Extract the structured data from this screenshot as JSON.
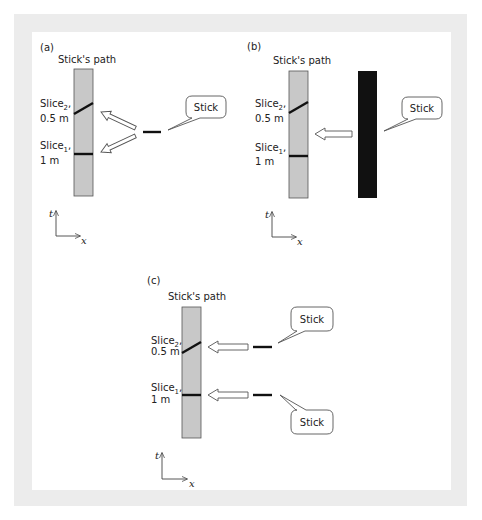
{
  "colors": {
    "frame": "#ececec",
    "background": "#ffffff",
    "path_fill": "#c8c8c8",
    "path_stroke": "#555555",
    "slice": "#111111",
    "stick": "#111111",
    "arrow_stroke": "#555555"
  },
  "panels": [
    {
      "id": "a",
      "label": "(a)",
      "path_title": "Stick's path",
      "slice2": {
        "name": "Slice",
        "sub": "2",
        "suffix": ",",
        "length": "0.5 m"
      },
      "slice1": {
        "name": "Slice",
        "sub": "1",
        "suffix": ",",
        "length": "1 m"
      },
      "stick_callouts": [
        "Stick"
      ],
      "axes": {
        "vertical": "t",
        "horizontal": "x"
      }
    },
    {
      "id": "b",
      "label": "(b)",
      "path_title": "Stick's path",
      "slice2": {
        "name": "Slice",
        "sub": "2",
        "suffix": ",",
        "length": "0.5 m"
      },
      "slice1": {
        "name": "Slice",
        "sub": "1",
        "suffix": ",",
        "length": "1 m"
      },
      "stick_callouts": [
        "Stick"
      ],
      "axes": {
        "vertical": "t",
        "horizontal": "x"
      }
    },
    {
      "id": "c",
      "label": "(c)",
      "path_title": "Stick's path",
      "slice2": {
        "name": "Slice",
        "sub": "2",
        "suffix": ",",
        "length": "0.5 m"
      },
      "slice1": {
        "name": "Slice",
        "sub": "1",
        "suffix": ",",
        "length": "1 m"
      },
      "stick_callouts": [
        "Stick",
        "Stick"
      ],
      "axes": {
        "vertical": "t",
        "horizontal": "x"
      }
    }
  ]
}
